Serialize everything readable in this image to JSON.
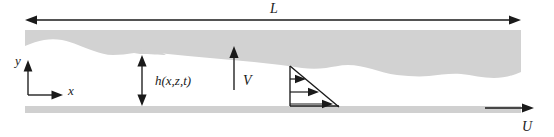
{
  "figure": {
    "type": "fluid-film-schematic"
  },
  "labels": {
    "length": "L",
    "axis_y": "y",
    "axis_x": "x",
    "film_thickness": "h(x,z,t)",
    "velocity_v": "V",
    "velocity_u": "U"
  },
  "icons": {
    "length_arrow": "double-headed-horizontal-arrow",
    "thickness_arrow": "double-headed-vertical-arrow",
    "v_arrow": "upward-arrow",
    "u_arrow": "rightward-arrow",
    "axis_y_arrow": "upward-arrow",
    "axis_x_arrow": "rightward-arrow",
    "profile": "linear-velocity-profile-triangle"
  },
  "colors": {
    "film_fill": "#d2d2d2",
    "plate_fill": "#d0d0d0",
    "ink": "#1a1a1a",
    "background": "#ffffff"
  },
  "geometry": {
    "length_arrow_y": 20,
    "length_arrow_x_start": 25,
    "length_arrow_x_end": 521,
    "film_top_y": 30,
    "plate_top_y": 106,
    "plate_bottom_y": 113,
    "film_left_x": 25,
    "film_right_x": 521,
    "origin_x": 28,
    "origin_y": 95,
    "thickness_arrow_x": 142,
    "v_arrow_x": 234,
    "profile_apex_x": 290,
    "profile_apex_y": 66,
    "profile_base_x": 337,
    "profile_base_y": 106,
    "u_arrow_y": 108,
    "u_arrow_x_start": 485,
    "u_arrow_x_end": 533
  }
}
